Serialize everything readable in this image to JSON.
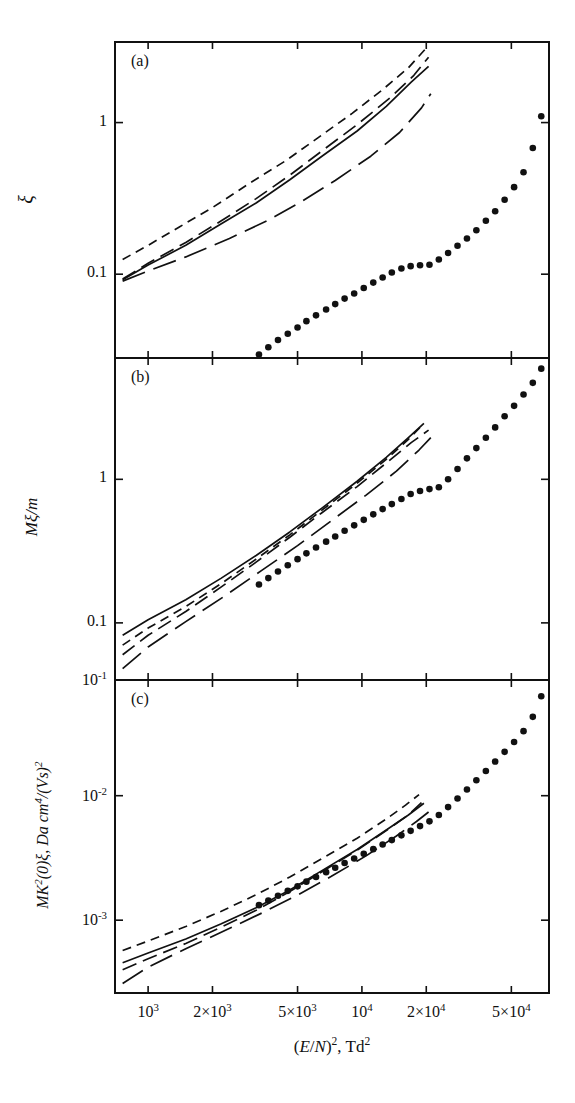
{
  "figure": {
    "width": 575,
    "height": 1103,
    "background": "#ffffff",
    "ink": "#111111"
  },
  "axis": {
    "x": {
      "label_html": "(<i>E</i>/<i>N</i>)<sup>2</sup>, Td<sup>2</sup>",
      "label_plain": "(E/N)^2, Td^2",
      "scale": "log",
      "min": 700,
      "max": 75000,
      "ticks": [
        {
          "value": 1000,
          "label": "10^3",
          "mant": "10",
          "exp": "3"
        },
        {
          "value": 2000,
          "label": "2x10^3",
          "mant": "2×10",
          "exp": "3"
        },
        {
          "value": 5000,
          "label": "5x10^3",
          "mant": "5×10",
          "exp": "3"
        },
        {
          "value": 10000,
          "label": "10^4",
          "mant": "10",
          "exp": "4"
        },
        {
          "value": 20000,
          "label": "2x10^4",
          "mant": "2×10",
          "exp": "4"
        },
        {
          "value": 50000,
          "label": "5x10^4",
          "mant": "5×10",
          "exp": "4"
        }
      ]
    }
  },
  "panels": [
    {
      "tag": "(a)",
      "ylabel_html": "&#958;",
      "ylabel_plain": "xi",
      "yscale": "log",
      "ymin": 0.028,
      "ymax": 3.4,
      "yticks": [
        {
          "value": 1,
          "label": "1"
        },
        {
          "value": 0.1,
          "label": "0.1"
        }
      ]
    },
    {
      "tag": "(b)",
      "ylabel_html": "<i>M</i>&#958;/<i>m</i>",
      "ylabel_plain": "M xi / m",
      "yscale": "log",
      "ymin": 0.04,
      "ymax": 7.0,
      "yticks": [
        {
          "value": 1,
          "label": "1"
        },
        {
          "value": 0.1,
          "label": "0.1"
        },
        {
          "value": 0.04,
          "label": "10^-1",
          "mant": "10",
          "exp": "-1"
        }
      ]
    },
    {
      "tag": "(c)",
      "ylabel_html": "<i>MK</i><sup>2</sup>(0)&#958;, Da cm<sup>4</sup>/(Vs)<sup>2</sup>",
      "ylabel_plain": "MK^2(0) xi, Da cm^4/(Vs)^2",
      "yscale": "log",
      "ymin": 0.00026,
      "ymax": 0.085,
      "yticks": [
        {
          "value": 0.01,
          "label": "10^-2",
          "mant": "10",
          "exp": "-2"
        },
        {
          "value": 0.001,
          "label": "10^-3",
          "mant": "10",
          "exp": "-3"
        }
      ]
    }
  ],
  "chart_data": {
    "type": "line",
    "title": "",
    "subtitle": "",
    "xlabel": "(E/N)^2, Td^2",
    "xscale": "log",
    "yscale": "log",
    "grid": false,
    "legend": "none",
    "shared_x": true,
    "panel_count": 3,
    "series_styles": {
      "solid": "solid line",
      "short_dash": "short dashed line",
      "medium_dash": "medium dashed line",
      "long_dash": "long dashed line",
      "dots": "filled round markers, no connecting line"
    },
    "panels": [
      {
        "tag": "(a)",
        "ylabel": "xi",
        "ylim": [
          0.028,
          3.4
        ],
        "yticks": [
          1,
          0.1
        ],
        "series": [
          {
            "name": "solid",
            "style": "solid",
            "x": [
              760,
              1000,
              1500,
              2200,
              3200,
              4600,
              6500,
              9500,
              13000,
              17000,
              20500
            ],
            "y": [
              0.092,
              0.115,
              0.155,
              0.215,
              0.295,
              0.42,
              0.6,
              0.88,
              1.28,
              1.85,
              2.35
            ]
          },
          {
            "name": "short_dash",
            "style": "short_dash",
            "x": [
              760,
              1000,
              1400,
              2000,
              3000,
              4400,
              6200,
              9000,
              12500,
              16500,
              20000
            ],
            "y": [
              0.125,
              0.155,
              0.205,
              0.275,
              0.4,
              0.56,
              0.79,
              1.15,
              1.65,
              2.3,
              3.1
            ]
          },
          {
            "name": "medium_dash",
            "style": "medium_dash",
            "x": [
              760,
              1000,
              1500,
              2200,
              3200,
              4600,
              6500,
              9500,
              13500,
              17500,
              20500
            ],
            "y": [
              0.093,
              0.118,
              0.162,
              0.225,
              0.315,
              0.45,
              0.65,
              0.97,
              1.45,
              2.05,
              2.7
            ]
          },
          {
            "name": "long_dash",
            "style": "long_dash",
            "x": [
              760,
              1000,
              1500,
              2400,
              3600,
              5200,
              7500,
              11000,
              15000,
              19000,
              21000
            ],
            "y": [
              0.09,
              0.105,
              0.13,
              0.172,
              0.225,
              0.3,
              0.415,
              0.6,
              0.86,
              1.25,
              1.55
            ]
          },
          {
            "name": "dots",
            "style": "dots",
            "x": [
              3300,
              3650,
              4050,
              4500,
              5000,
              5500,
              6100,
              6800,
              7500,
              8300,
              9200,
              10200,
              11300,
              12500,
              13800,
              15300,
              16900,
              18700,
              20700,
              22900,
              25300,
              28000,
              31000,
              34300,
              38000,
              42000,
              46500,
              51500,
              57000,
              63000,
              69000
            ],
            "y": [
              0.0295,
              0.033,
              0.0368,
              0.0405,
              0.0445,
              0.049,
              0.0535,
              0.0585,
              0.0635,
              0.069,
              0.0745,
              0.081,
              0.088,
              0.095,
              0.1025,
              0.109,
              0.113,
              0.1145,
              0.1155,
              0.125,
              0.138,
              0.154,
              0.172,
              0.195,
              0.225,
              0.26,
              0.31,
              0.375,
              0.47,
              0.68,
              1.1
            ]
          }
        ]
      },
      {
        "tag": "(b)",
        "ylabel": "M xi / m",
        "ylim": [
          0.04,
          7.0
        ],
        "yticks": [
          1,
          0.1
        ],
        "series": [
          {
            "name": "solid",
            "style": "solid",
            "x": [
              760,
              1000,
              1500,
              2200,
              3200,
              4600,
              6500,
              9500,
              13000,
              16500,
              19500
            ],
            "y": [
              0.082,
              0.105,
              0.145,
              0.205,
              0.295,
              0.43,
              0.63,
              0.97,
              1.42,
              1.95,
              2.45
            ]
          },
          {
            "name": "short_dash",
            "style": "short_dash",
            "x": [
              760,
              1000,
              1500,
              2200,
              3200,
              4600,
              6500,
              9500,
              13000,
              16500,
              19000
            ],
            "y": [
              0.07,
              0.092,
              0.13,
              0.188,
              0.278,
              0.41,
              0.61,
              0.94,
              1.38,
              1.9,
              2.35
            ]
          },
          {
            "name": "medium_dash",
            "style": "medium_dash",
            "x": [
              760,
              1000,
              1500,
              2200,
              3200,
              4600,
              6500,
              9500,
              13000,
              17000,
              20500
            ],
            "y": [
              0.06,
              0.082,
              0.12,
              0.178,
              0.265,
              0.395,
              0.585,
              0.89,
              1.3,
              1.8,
              2.2
            ]
          },
          {
            "name": "long_dash",
            "style": "long_dash",
            "x": [
              760,
              1000,
              1500,
              2300,
              3400,
              5000,
              7200,
              10500,
              14500,
              18500,
              21000
            ],
            "y": [
              0.048,
              0.068,
              0.102,
              0.155,
              0.232,
              0.345,
              0.515,
              0.78,
              1.14,
              1.6,
              1.95
            ]
          },
          {
            "name": "dots",
            "style": "dots",
            "x": [
              3300,
              3650,
              4050,
              4500,
              5000,
              5500,
              6100,
              6800,
              7500,
              8300,
              9200,
              10200,
              11300,
              12500,
              13800,
              15300,
              16900,
              18700,
              20700,
              22900,
              25300,
              28000,
              31000,
              34300,
              38000,
              42000,
              46500,
              51500,
              57000,
              63000,
              69000
            ],
            "y": [
              0.185,
              0.205,
              0.228,
              0.252,
              0.278,
              0.305,
              0.335,
              0.368,
              0.4,
              0.438,
              0.478,
              0.522,
              0.57,
              0.62,
              0.672,
              0.73,
              0.79,
              0.83,
              0.855,
              0.88,
              1.0,
              1.18,
              1.4,
              1.65,
              1.95,
              2.3,
              2.75,
              3.25,
              3.9,
              4.7,
              5.9
            ]
          }
        ]
      },
      {
        "tag": "(c)",
        "ylabel": "MK^2(0) xi, Da cm^4/(Vs)^2",
        "ylim": [
          0.00026,
          0.085
        ],
        "yticks": [
          0.01,
          0.001
        ],
        "series": [
          {
            "name": "solid",
            "style": "solid",
            "x": [
              760,
              1000,
              1500,
              2200,
              3200,
              4600,
              6500,
              9500,
              13000,
              16500,
              19500
            ],
            "y": [
              0.000455,
              0.000545,
              0.000705,
              0.000935,
              0.00126,
              0.00175,
              0.0025,
              0.0037,
              0.0053,
              0.007,
              0.0087
            ]
          },
          {
            "name": "short_dash",
            "style": "short_dash",
            "x": [
              760,
              1000,
              1500,
              2200,
              3200,
              4600,
              6500,
              9500,
              13000,
              16000,
              18500
            ],
            "y": [
              0.00057,
              0.00068,
              0.00089,
              0.00118,
              0.0016,
              0.00222,
              0.00312,
              0.00455,
              0.0065,
              0.0084,
              0.0102
            ]
          },
          {
            "name": "medium_dash",
            "style": "medium_dash",
            "x": [
              760,
              1000,
              1500,
              2200,
              3200,
              4600,
              6500,
              9500,
              13000,
              16500,
              19000
            ],
            "y": [
              0.0004,
              0.00049,
              0.00065,
              0.00088,
              0.0012,
              0.0017,
              0.00245,
              0.00365,
              0.00525,
              0.007,
              0.0088
            ]
          },
          {
            "name": "long_dash",
            "style": "long_dash",
            "x": [
              760,
              1000,
              1500,
              2300,
              3400,
              5000,
              7200,
              10500,
              14500,
              18000,
              20500
            ],
            "y": [
              0.00031,
              0.00042,
              0.00059,
              0.00083,
              0.00114,
              0.00159,
              0.00225,
              0.0033,
              0.00475,
              0.0062,
              0.0074
            ]
          },
          {
            "name": "dots",
            "style": "dots",
            "x": [
              3300,
              3650,
              4050,
              4500,
              5000,
              5500,
              6100,
              6800,
              7500,
              8300,
              9200,
              10200,
              11300,
              12500,
              13800,
              15300,
              16900,
              18700,
              20700,
              22900,
              25300,
              28000,
              31000,
              34300,
              38000,
              42000,
              46500,
              51500,
              57000,
              63000,
              69000
            ],
            "y": [
              0.00132,
              0.00144,
              0.00157,
              0.00172,
              0.00187,
              0.00204,
              0.00222,
              0.00243,
              0.00264,
              0.00288,
              0.00313,
              0.00341,
              0.00372,
              0.00405,
              0.0044,
              0.0048,
              0.00522,
              0.0057,
              0.00622,
              0.007,
              0.0081,
              0.0095,
              0.0112,
              0.0133,
              0.0158,
              0.0188,
              0.0225,
              0.027,
              0.033,
              0.043,
              0.063
            ]
          }
        ]
      }
    ]
  }
}
